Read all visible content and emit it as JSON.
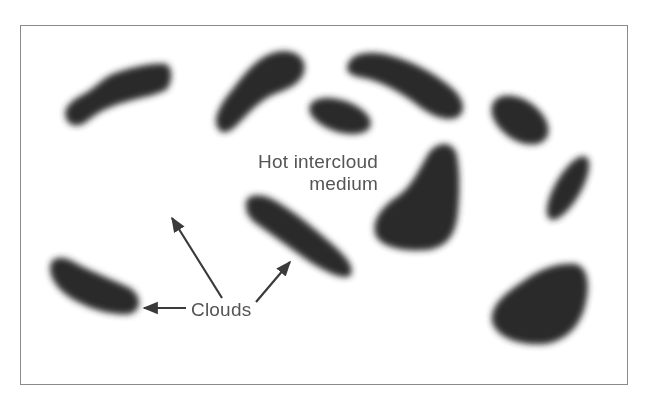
{
  "diagram": {
    "labels": {
      "intercloud_line1": "Hot intercloud",
      "intercloud_line2": "medium",
      "clouds": "Clouds"
    },
    "colors": {
      "cloud_fill": "#2b2b2b",
      "frame_border": "#8a8a8a",
      "label_text": "#555555",
      "arrow": "#3a3a3a",
      "background": "#ffffff"
    },
    "clouds_count": 11,
    "arrows_from_clouds_label": 3
  }
}
